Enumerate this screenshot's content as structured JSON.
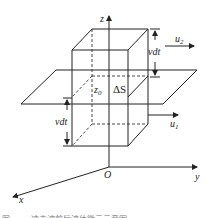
{
  "diagram": {
    "axes": {
      "z_label": "z",
      "y_label": "y",
      "x_label": "x",
      "origin_label": "O"
    },
    "labels": {
      "upper_height": "vdt",
      "lower_height": "vdt",
      "u2": {
        "base": "u",
        "sub": "2"
      },
      "u1": {
        "base": "u",
        "sub": "1"
      },
      "z0": {
        "base": "z",
        "sub": "0"
      },
      "area": "ΔS"
    },
    "caption": "图 …… 冲击波前后流体微元示意图"
  }
}
